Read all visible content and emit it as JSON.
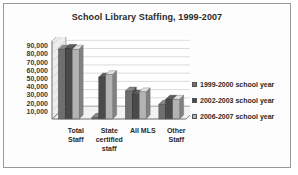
{
  "chart_data": {
    "type": "bar",
    "title": "School Library Staffing, 1999-2007",
    "xlabel": "",
    "ylabel": "",
    "ylim": [
      0,
      95000
    ],
    "ytick_values": [
      90000,
      80000,
      70000,
      60000,
      50000,
      40000,
      30000,
      20000,
      10000
    ],
    "ytick_labels": [
      "90,000",
      "80,000",
      "70,000",
      "60,000",
      "50,000",
      "40,000",
      "30,000",
      "20,000",
      "10,000"
    ],
    "grid": true,
    "legend_position": "right",
    "style": "3d-grouped-column",
    "categories": [
      "Total\nStaff",
      "State\ncertified\nstaff",
      "All MLS",
      "Other\nStaff"
    ],
    "category_labels_flat": [
      "Total Staff",
      "State certified staff",
      "All MLS",
      "Other Staff"
    ],
    "series": [
      {
        "name": "1999-2000 school year",
        "color": "#6e6e6e",
        "values": [
          85000,
          2000,
          34000,
          18000
        ]
      },
      {
        "name": "2002-2003 school year",
        "color": "#4a4a4a",
        "values": [
          86000,
          51000,
          30000,
          24000
        ]
      },
      {
        "name": "2006-2007 school year",
        "color": "#b3b3b3",
        "values": [
          85000,
          54000,
          33000,
          24000
        ]
      }
    ]
  },
  "frame": {
    "border_color": "#9a9a9a",
    "background": "#fdfdfd"
  }
}
